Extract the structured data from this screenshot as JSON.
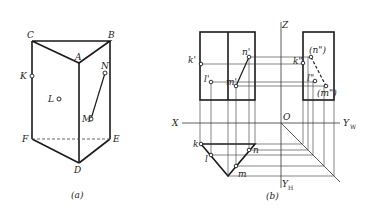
{
  "figure_a": {
    "caption": "(a)",
    "vertices": {
      "A": "A",
      "B": "B",
      "C": "C",
      "D": "D",
      "E": "E",
      "F": "F"
    },
    "points": {
      "K": "K",
      "L": "L",
      "M": "M",
      "N": "N"
    }
  },
  "figure_b": {
    "caption": "(b)",
    "axes": {
      "Z": "Z",
      "X": "X",
      "O": "O",
      "YW": "Y",
      "YW_sub": "W",
      "YH": "Y",
      "YH_sub": "H"
    },
    "front_view": {
      "k1": "k'",
      "l1": "l'",
      "m1": "m'",
      "n1": "n'"
    },
    "side_view": {
      "n2": "(n\")",
      "k2": "k\"",
      "l2": "l\"",
      "m2": "(m\")"
    },
    "top_view": {
      "k": "k",
      "l": "l",
      "m": "m",
      "n": "n"
    }
  }
}
